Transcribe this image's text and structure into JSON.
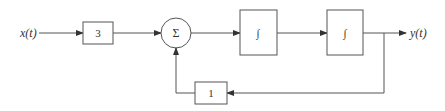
{
  "diagram": {
    "type": "block-diagram",
    "input": {
      "label": "x(t)"
    },
    "output": {
      "label": "y(t)"
    },
    "blocks": [
      {
        "id": "gain",
        "label": "3"
      },
      {
        "id": "summer",
        "label": "Σ"
      },
      {
        "id": "integrator1",
        "label": "∫"
      },
      {
        "id": "integrator2",
        "label": "∫"
      },
      {
        "id": "feedback-gain",
        "label": "1"
      }
    ],
    "connections": [
      {
        "from": "x(t)",
        "to": "gain"
      },
      {
        "from": "gain",
        "to": "summer"
      },
      {
        "from": "summer",
        "to": "integrator1"
      },
      {
        "from": "integrator1",
        "to": "integrator2"
      },
      {
        "from": "integrator2",
        "to": "y(t)"
      },
      {
        "from": "y(t)",
        "to": "feedback-gain"
      },
      {
        "from": "feedback-gain",
        "to": "summer"
      }
    ],
    "colors": {
      "stroke": "#555555",
      "text": "#333333",
      "background": "#ffffff"
    }
  }
}
